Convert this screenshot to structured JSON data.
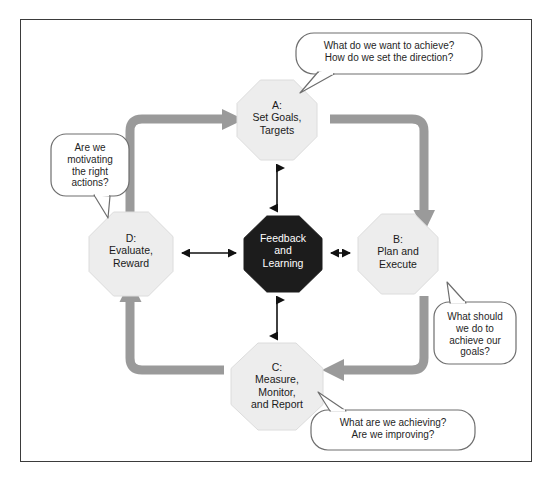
{
  "diagram": {
    "colors": {
      "frame_border": "#3b3b3b",
      "cycle_arrow": "#9a9a9a",
      "node_fill": "#ededed",
      "node_border": "#d9d9d9",
      "center_fill": "#1c1c1c",
      "center_text": "#ffffff",
      "connector": "#111111",
      "bubble_border": "#6e6e6e",
      "bubble_fill": "#ffffff",
      "background": "#ffffff"
    },
    "nodes": [
      {
        "id": "a",
        "label": "A:\nSet Goals,\nTargets",
        "position": "top"
      },
      {
        "id": "b",
        "label": "B:\nPlan and\nExecute",
        "position": "right"
      },
      {
        "id": "c",
        "label": "C:\nMeasure,\nMonitor,\nand Report",
        "position": "bottom"
      },
      {
        "id": "d",
        "label": "D:\nEvaluate,\nReward",
        "position": "left"
      },
      {
        "id": "center",
        "label": "Feedback\nand\nLearning",
        "position": "center"
      }
    ],
    "bubbles": [
      {
        "id": "bubble-a",
        "text": "What do we want to achieve?\nHow do we set the direction?",
        "points_to": "a"
      },
      {
        "id": "bubble-b",
        "text": "What should\nwe do to\nachieve our\ngoals?",
        "points_to": "b"
      },
      {
        "id": "bubble-c",
        "text": "What are we achieving?\nAre we improving?",
        "points_to": "c"
      },
      {
        "id": "bubble-d",
        "text": "Are we\nmotivating\nthe right\nactions?",
        "points_to": "d"
      }
    ],
    "cycle_flow": [
      "d-to-a",
      "a-to-b",
      "b-to-c",
      "c-to-d"
    ],
    "connectors": [
      "a-center",
      "b-center",
      "c-center",
      "d-center"
    ]
  }
}
